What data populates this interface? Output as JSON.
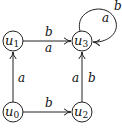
{
  "diagram": {
    "type": "automaton",
    "nodes": [
      {
        "id": "u0",
        "name": "u",
        "sub": "0",
        "x": 13,
        "y": 112
      },
      {
        "id": "u1",
        "name": "u",
        "sub": "1",
        "x": 13,
        "y": 41
      },
      {
        "id": "u2",
        "name": "u",
        "sub": "2",
        "x": 82,
        "y": 112
      },
      {
        "id": "u3",
        "name": "u",
        "sub": "3",
        "x": 82,
        "y": 41
      }
    ],
    "edges": [
      {
        "from": "u0",
        "to": "u1",
        "labels": [
          "a"
        ]
      },
      {
        "from": "u0",
        "to": "u2",
        "labels": [
          "b"
        ]
      },
      {
        "from": "u1",
        "to": "u3",
        "labels": [
          "b",
          "a"
        ]
      },
      {
        "from": "u2",
        "to": "u3",
        "labels": [
          "a",
          "b"
        ]
      },
      {
        "from": "u3",
        "to": "u3",
        "labels": [
          "a",
          "b"
        ]
      }
    ],
    "labels": {
      "u0_u1": "a",
      "u0_u2": "b",
      "u1_u3_top": "b",
      "u1_u3_bottom": "a",
      "u2_u3_left": "a",
      "u2_u3_right": "b",
      "loop_inner": "a",
      "loop_outer": "b"
    }
  }
}
